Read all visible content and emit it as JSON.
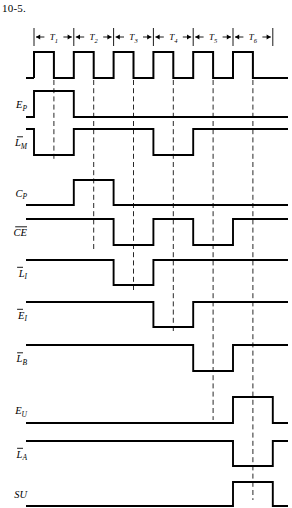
{
  "figure": {
    "number": "10-5.",
    "type": "timing-diagram"
  },
  "timing": {
    "periods": [
      {
        "label": "T",
        "subscript": "1"
      },
      {
        "label": "T",
        "subscript": "2"
      },
      {
        "label": "T",
        "subscript": "3"
      },
      {
        "label": "T",
        "subscript": "4"
      },
      {
        "label": "T",
        "subscript": "5"
      },
      {
        "label": "T",
        "subscript": "6"
      }
    ],
    "period_count": 6,
    "clock_label": "CLK",
    "clock_description": "Square wave, one cycle per T state, high first half"
  },
  "signals": [
    {
      "name": "E_P",
      "base": "E",
      "subscript": "P",
      "overbar": false,
      "active_level": "high",
      "active_periods": [
        1
      ],
      "description": "Enable program counter, high during T1"
    },
    {
      "name": "L_M_bar",
      "base": "L",
      "subscript": "M",
      "overbar": true,
      "active_level": "low",
      "active_periods": [
        1,
        4
      ],
      "description": "Load MAR, active low during T1 and T4"
    },
    {
      "name": "C_P",
      "base": "C",
      "subscript": "P",
      "overbar": false,
      "active_level": "high",
      "active_periods": [
        2
      ],
      "description": "Increment program counter, high during T2"
    },
    {
      "name": "CE_bar",
      "base": "CE",
      "subscript": "",
      "overbar": true,
      "active_level": "low",
      "active_periods": [
        3,
        5
      ],
      "description": "Chip enable RAM, active low during T3 and T5"
    },
    {
      "name": "L_I_bar",
      "base": "L",
      "subscript": "I",
      "overbar": true,
      "active_level": "low",
      "active_periods": [
        3
      ],
      "description": "Load instruction register, active low during T3"
    },
    {
      "name": "E_I_bar",
      "base": "E",
      "subscript": "I",
      "overbar": true,
      "active_level": "low",
      "active_periods": [
        4
      ],
      "description": "Enable instruction register, active low during T4"
    },
    {
      "name": "L_B_bar",
      "base": "L",
      "subscript": "B",
      "overbar": true,
      "active_level": "low",
      "active_periods": [
        5
      ],
      "description": "Load B register, active low during T5"
    },
    {
      "name": "E_U",
      "base": "E",
      "subscript": "U",
      "overbar": false,
      "active_level": "high",
      "active_periods": [
        6
      ],
      "description": "Enable adder/subtracter, high during T6"
    },
    {
      "name": "L_A_bar",
      "base": "L",
      "subscript": "A",
      "overbar": true,
      "active_level": "low",
      "active_periods": [
        6
      ],
      "description": "Load accumulator, active low during T6"
    },
    {
      "name": "SU",
      "base": "SU",
      "subscript": "",
      "overbar": false,
      "active_level": "high",
      "active_periods": [
        6
      ],
      "description": "Subtract control, high during T6"
    }
  ],
  "chart_data": {
    "type": "line",
    "xlabel": "",
    "ylabel": "",
    "categories": [
      "T1",
      "T2",
      "T3",
      "T4",
      "T5",
      "T6"
    ],
    "series": [
      {
        "name": "CLK",
        "values": [
          1,
          1,
          1,
          1,
          1,
          1
        ]
      },
      {
        "name": "E_P",
        "values": [
          1,
          0,
          0,
          0,
          0,
          0
        ]
      },
      {
        "name": "L_M_bar",
        "values": [
          0,
          1,
          1,
          0,
          1,
          1
        ]
      },
      {
        "name": "C_P",
        "values": [
          0,
          1,
          0,
          0,
          0,
          0
        ]
      },
      {
        "name": "CE_bar",
        "values": [
          1,
          1,
          0,
          1,
          0,
          1
        ]
      },
      {
        "name": "L_I_bar",
        "values": [
          1,
          1,
          0,
          1,
          1,
          1
        ]
      },
      {
        "name": "E_I_bar",
        "values": [
          1,
          1,
          1,
          0,
          1,
          1
        ]
      },
      {
        "name": "L_B_bar",
        "values": [
          1,
          1,
          1,
          1,
          0,
          1
        ]
      },
      {
        "name": "E_U",
        "values": [
          0,
          0,
          0,
          0,
          0,
          1
        ]
      },
      {
        "name": "L_A_bar",
        "values": [
          1,
          1,
          1,
          1,
          1,
          0
        ]
      },
      {
        "name": "SU",
        "values": [
          0,
          0,
          0,
          0,
          0,
          1
        ]
      }
    ],
    "legend_position": "left",
    "grid": false
  }
}
